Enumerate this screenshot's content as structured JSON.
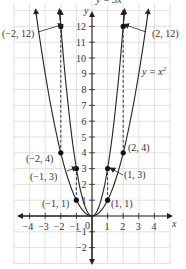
{
  "chart_data": {
    "type": "line",
    "title": "",
    "xlabel": "x",
    "ylabel": "y",
    "xlim": [
      -5,
      5
    ],
    "ylim": [
      -3,
      13
    ],
    "grid": true,
    "x_ticks": [
      "-4",
      "-3",
      "-2",
      "-1",
      "0",
      "1",
      "2",
      "3",
      "4"
    ],
    "y_ticks": [
      "-2",
      "-1",
      "1",
      "2",
      "3",
      "4",
      "5",
      "6",
      "7",
      "8",
      "9",
      "10",
      "11",
      "12"
    ],
    "series": [
      {
        "name": "y = x²",
        "label": "y = x",
        "superscript": "2",
        "function": "x^2",
        "points": [
          [
            -1,
            1
          ],
          [
            1,
            1
          ],
          [
            -2,
            4
          ],
          [
            2,
            4
          ]
        ]
      },
      {
        "name": "y = 3x²",
        "label": "y = 3x",
        "superscript": "2",
        "function": "3x^2",
        "points": [
          [
            -1,
            3
          ],
          [
            1,
            3
          ],
          [
            -2,
            12
          ],
          [
            2,
            12
          ]
        ]
      }
    ],
    "annotations": [
      {
        "text": "(−2, 12)",
        "x": -2,
        "y": 12
      },
      {
        "text": "(2, 12)",
        "x": 2,
        "y": 12
      },
      {
        "text": "(−2, 4)",
        "x": -2,
        "y": 4
      },
      {
        "text": "(2, 4)",
        "x": 2,
        "y": 4
      },
      {
        "text": "(−1, 3)",
        "x": -1,
        "y": 3
      },
      {
        "text": "(1, 3)",
        "x": 1,
        "y": 3
      },
      {
        "text": "(−1, 1)",
        "x": -1,
        "y": 1
      },
      {
        "text": "(1, 1)",
        "x": 1,
        "y": 1
      }
    ],
    "dashed_segments": [
      [
        [
          -1,
          1
        ],
        [
          -1,
          3
        ]
      ],
      [
        [
          1,
          1
        ],
        [
          1,
          3
        ]
      ],
      [
        [
          -2,
          4
        ],
        [
          -2,
          12
        ]
      ],
      [
        [
          2,
          4
        ],
        [
          2,
          12
        ]
      ]
    ]
  },
  "labels": {
    "x_axis": "x",
    "y_axis": "y",
    "origin": "0",
    "eq_top": "y = 3x",
    "eq_top_sup": "2",
    "eq_right": "y = x",
    "eq_right_sup": "2",
    "pt_m2_12": "(−2, 12)",
    "pt_2_12": "(2, 12)",
    "pt_m2_4": "(−2, 4)",
    "pt_2_4": "(2, 4)",
    "pt_m1_3": "(−1, 3)",
    "pt_1_3": "(1, 3)",
    "pt_m1_1": "(−1, 1)",
    "pt_1_1": "(1, 1)"
  }
}
